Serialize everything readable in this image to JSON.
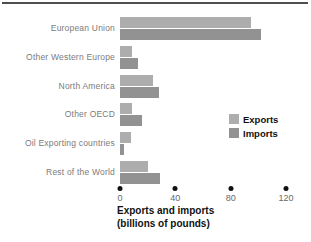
{
  "figure": {
    "axis_title_line1": "Exports and imports",
    "axis_title_line2": "(billions of pounds)",
    "legend": {
      "exports_label": "Exports",
      "imports_label": "Imports"
    }
  },
  "colors": {
    "exports_bar": "#adadad",
    "imports_bar": "#929292",
    "category_label_text": "#7b7b7b",
    "tick_label_text": "#686868",
    "tick_dot": "#101010",
    "title_text": "#111111",
    "top_rule": "#4f4f4f",
    "background": "#ffffff"
  },
  "chart_data": {
    "type": "bar",
    "orientation": "horizontal",
    "title": "Exports and imports (billions of pounds)",
    "xlabel": "Exports and imports (billions of pounds)",
    "ylabel": "",
    "categories": [
      "European Union",
      "Other Western Europe",
      "North America",
      "Other OECD",
      "Oil Exporting countries",
      "Rest of the World"
    ],
    "series": [
      {
        "name": "Exports",
        "values": [
          95,
          9,
          24,
          9,
          8,
          20
        ]
      },
      {
        "name": "Imports",
        "values": [
          102,
          13,
          28,
          16,
          3,
          29
        ]
      }
    ],
    "x_ticks": [
      0,
      40,
      80,
      120
    ],
    "xlim": [
      0,
      120
    ],
    "grid": false,
    "legend_position": "middle-right",
    "tick_marker": "dot"
  }
}
